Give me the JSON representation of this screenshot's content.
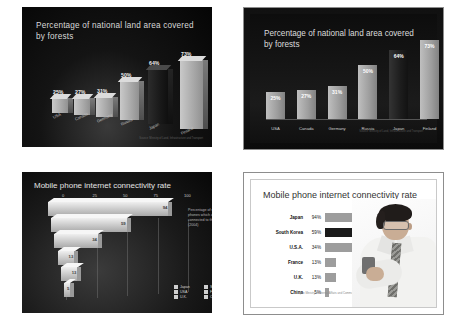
{
  "chart_data": [
    {
      "type": "bar",
      "title": "Percentage of national land area covered by forests",
      "panel": "top-left-3d",
      "categories": [
        "USA",
        "Canada",
        "Germany",
        "Russia",
        "Japan",
        "Finland"
      ],
      "values": [
        25,
        27,
        31,
        50,
        64,
        73
      ],
      "value_labels": [
        "25%",
        "27%",
        "31%",
        "50%",
        "64%",
        "73%"
      ],
      "highlight_category": "Japan",
      "source": "Source: Ministry of Land, Infrastructure and Transport",
      "xlabel": "",
      "ylabel": "",
      "ylim": [
        0,
        80
      ],
      "grid": false,
      "legend": "none",
      "style": "3d-perspective-dark"
    },
    {
      "type": "bar",
      "title": "Percentage of national land area covered by forests",
      "panel": "top-right-flat",
      "categories": [
        "USA",
        "Canada",
        "Germany",
        "Russia",
        "Japan",
        "Finland"
      ],
      "values": [
        25,
        27,
        31,
        50,
        64,
        73
      ],
      "value_labels": [
        "25%",
        "27%",
        "31%",
        "50%",
        "64%",
        "73%"
      ],
      "highlight_category": "Japan",
      "source": "Source: Ministry of Land, Infrastructure and Transport",
      "xlabel": "",
      "ylabel": "",
      "ylim": [
        0,
        80
      ],
      "grid": false,
      "legend": "none",
      "style": "flat-dark"
    },
    {
      "type": "bar",
      "orientation": "horizontal",
      "title": "Mobile phone internet connectivity rate",
      "panel": "bottom-left-3d",
      "categories": [
        "Japan",
        "S. Korea",
        "USA",
        "France",
        "U.K.",
        "China"
      ],
      "values": [
        94,
        59,
        34,
        13,
        13,
        5
      ],
      "value_labels": [
        "94",
        "59",
        "34",
        "13",
        "13",
        "5"
      ],
      "xticks": [
        "0",
        "25",
        "50",
        "75",
        "100"
      ],
      "xlim": [
        0,
        100
      ],
      "note": "Percentage of mobile phones which are connected to the Internet (2004)",
      "legend_position": "bottom-right",
      "legend": [
        "Japan",
        "S. Korea",
        "USA",
        "France",
        "U.K.",
        "China"
      ],
      "grid": true,
      "style": "3d-perspective-dark"
    },
    {
      "type": "bar",
      "orientation": "horizontal",
      "title": "Mobile phone internet connectivity rate",
      "panel": "bottom-right-flat",
      "categories": [
        "Japan",
        "South Korea",
        "U.S.A.",
        "France",
        "U.K.",
        "China"
      ],
      "values": [
        94,
        59,
        34,
        13,
        13,
        5
      ],
      "value_labels": [
        "94%",
        "59%",
        "34%",
        "13%",
        "13%",
        "5%"
      ],
      "highlight_category": "South Korea",
      "source": "Japan Ministry of Internal Affairs and Communications",
      "xlim": [
        0,
        100
      ],
      "grid": false,
      "legend": "none",
      "style": "flat-light-with-photo"
    }
  ],
  "panel1": {
    "title": "Percentage of national land area covered by forests",
    "source": "Source: Ministry of Land, Infrastructure and Transport",
    "bars": [
      {
        "cat": "USA",
        "val": "25%",
        "n": 25
      },
      {
        "cat": "Canada",
        "val": "27%",
        "n": 27
      },
      {
        "cat": "Germany",
        "val": "31%",
        "n": 31
      },
      {
        "cat": "Russia",
        "val": "50%",
        "n": 50
      },
      {
        "cat": "Japan",
        "val": "64%",
        "n": 64
      },
      {
        "cat": "Finland",
        "val": "73%",
        "n": 73
      }
    ]
  },
  "panel2": {
    "title": "Percentage of national land area covered by forests",
    "source": "Source: Ministry of Land, Infrastructure and Transport",
    "bars": [
      {
        "cat": "USA",
        "val": "25%",
        "n": 25
      },
      {
        "cat": "Canada",
        "val": "27%",
        "n": 27
      },
      {
        "cat": "Germany",
        "val": "31%",
        "n": 31
      },
      {
        "cat": "Russia",
        "val": "50%",
        "n": 50
      },
      {
        "cat": "Japan",
        "val": "64%",
        "n": 64
      },
      {
        "cat": "Finland",
        "val": "73%",
        "n": 73
      }
    ]
  },
  "panel3": {
    "title": "Mobile phone internet connectivity rate",
    "note": "Percentage of mobile phones which are connected to the Internet (2004)",
    "ticks": [
      "0",
      "25",
      "50",
      "75",
      "100"
    ],
    "bars": [
      {
        "cat": "Japan",
        "val": "94",
        "n": 94
      },
      {
        "cat": "S. Korea",
        "val": "59",
        "n": 59
      },
      {
        "cat": "USA",
        "val": "34",
        "n": 34
      },
      {
        "cat": "France",
        "val": "13",
        "n": 13
      },
      {
        "cat": "U.K.",
        "val": "13",
        "n": 13
      },
      {
        "cat": "China",
        "val": "5",
        "n": 5
      }
    ],
    "legend": [
      "Japan",
      "S. Korea",
      "USA",
      "France",
      "U.K.",
      "China"
    ]
  },
  "panel4": {
    "title": "Mobile phone internet connectivity rate",
    "source": "Japan Ministry of Internal Affairs and Communications",
    "bars": [
      {
        "cat": "Japan",
        "val": "94%",
        "n": 94
      },
      {
        "cat": "South Korea",
        "val": "59%",
        "n": 59
      },
      {
        "cat": "U.S.A.",
        "val": "34%",
        "n": 34
      },
      {
        "cat": "France",
        "val": "13%",
        "n": 13
      },
      {
        "cat": "U.K.",
        "val": "13%",
        "n": 13
      },
      {
        "cat": "China",
        "val": "5%",
        "n": 5
      }
    ]
  }
}
